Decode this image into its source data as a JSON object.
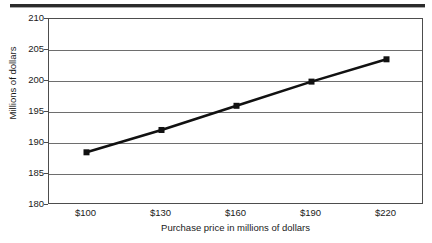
{
  "chart_data": {
    "type": "line",
    "title": "",
    "xlabel": "Purchase price in millions of dollars",
    "ylabel": "Millions of dollars",
    "x": [
      100,
      130,
      160,
      190,
      220
    ],
    "categories": [
      "$100",
      "$130",
      "$160",
      "$190",
      "$220"
    ],
    "values": [
      188.5,
      192.1,
      196.0,
      199.9,
      203.5
    ],
    "series": [
      {
        "name": "",
        "values": [
          188.5,
          192.1,
          196.0,
          199.9,
          203.5
        ]
      }
    ],
    "xlim": [
      85,
      235
    ],
    "ylim": [
      180,
      210
    ],
    "ytick_labels": [
      "210",
      "205",
      "200",
      "195",
      "190",
      "185",
      "180"
    ],
    "ytick_values": [
      210,
      205,
      200,
      195,
      190,
      185,
      180
    ],
    "xtick_labels": [
      "$100",
      "$130",
      "$160",
      "$190",
      "$220"
    ],
    "grid": "horizontal",
    "legend": "none",
    "marker": "square",
    "line_color": "#111111",
    "marker_color": "#111111",
    "grid_color": "#6e6e6e",
    "frame_color": "#4d4d4d",
    "background": "#ffffff"
  },
  "axes": {
    "y_title": "Millions of dollars",
    "x_title": "Purchase price in millions of dollars",
    "y_ticks": [
      {
        "label": "210",
        "value": 210
      },
      {
        "label": "205",
        "value": 205
      },
      {
        "label": "200",
        "value": 200
      },
      {
        "label": "195",
        "value": 195
      },
      {
        "label": "190",
        "value": 190
      },
      {
        "label": "185",
        "value": 185
      },
      {
        "label": "180",
        "value": 180
      }
    ],
    "x_ticks": [
      {
        "label": "$100",
        "value": 100
      },
      {
        "label": "$130",
        "value": 130
      },
      {
        "label": "$160",
        "value": 160
      },
      {
        "label": "$190",
        "value": 190
      },
      {
        "label": "$220",
        "value": 220
      }
    ]
  },
  "decorations": {
    "top_rule": ""
  }
}
